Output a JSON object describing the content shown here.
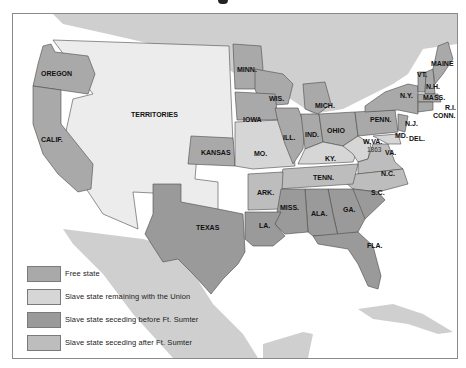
{
  "colors": {
    "free_state": "#a9a9a9",
    "slave_union": "#d6d6d6",
    "seceding_before": "#9a9a9a",
    "seceding_after": "#bdbdbd",
    "territories": "#ececec",
    "foreign_land": "#cfcfcf",
    "water": "#ffffff",
    "border": "#4a4a4a"
  },
  "map": {
    "regions": {
      "oregon": "OREGON",
      "california": "CALIF.",
      "territories": "TERRITORIES",
      "kansas": "KANSAS",
      "texas": "TEXAS",
      "minnesota": "MINN.",
      "wisconsin": "WIS.",
      "iowa": "IOWA",
      "missouri": "MO.",
      "illinois": "ILL.",
      "michigan": "MICH.",
      "indiana": "IND.",
      "ohio": "OHIO",
      "kentucky": "KY.",
      "west_virginia": "W.VA.",
      "west_virginia_year": "1863",
      "virginia": "VA.",
      "pennsylvania": "PENN.",
      "new_york": "N.Y.",
      "vermont": "VT.",
      "new_hampshire": "N.H.",
      "maine": "MAINE",
      "massachusetts": "MASS.",
      "rhode_island": "R.I.",
      "connecticut": "CONN.",
      "new_jersey": "N.J.",
      "maryland": "MD.",
      "delaware": "DEL.",
      "tennessee": "TENN.",
      "north_carolina": "N.C.",
      "south_carolina": "S.C.",
      "arkansas": "ARK.",
      "mississippi": "MISS.",
      "alabama": "ALA.",
      "georgia": "GA.",
      "louisiana": "LA.",
      "florida": "FLA."
    }
  },
  "legend": {
    "items": [
      {
        "label": "Free state",
        "category": "free_state"
      },
      {
        "label": "Slave state remaining with the Union",
        "category": "slave_union"
      },
      {
        "label": "Slave state seceding before Ft. Sumter",
        "category": "seceding_before"
      },
      {
        "label": "Slave state seceding after Ft. Sumter",
        "category": "seceding_after"
      }
    ]
  }
}
